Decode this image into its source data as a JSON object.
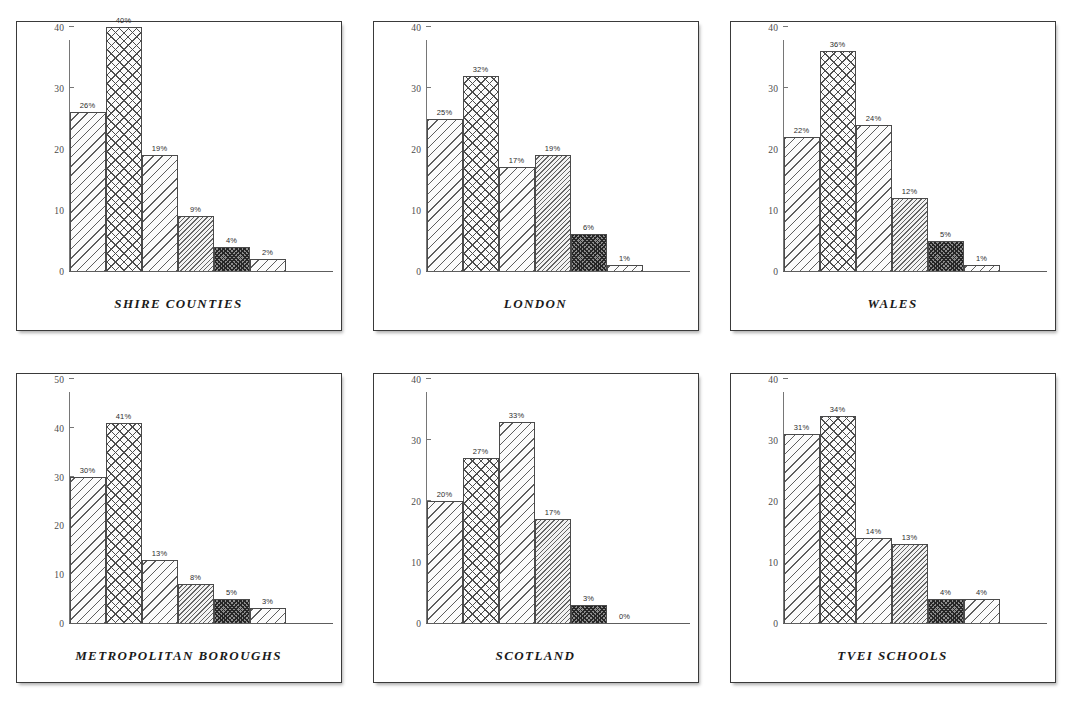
{
  "page": {
    "background_color": "#ffffff",
    "panel_border_color": "#3a3a3a",
    "axis_color": "#767676",
    "label_color": "#2d2d2d"
  },
  "bar_patterns": [
    "diagonal-light-hatch",
    "crosshatch-light",
    "diagonal-light-hatch",
    "diagonal-dense-hatch",
    "crosshatch-dense-dark",
    "diagonal-light-hatch"
  ],
  "chart_data": [
    {
      "type": "bar",
      "title": "SHIRE COUNTIES",
      "categories": [
        "1",
        "2",
        "3",
        "4",
        "5",
        "6"
      ],
      "values": [
        26,
        40,
        19,
        9,
        4,
        2
      ],
      "labels": [
        "26%",
        "40%",
        "19%",
        "9%",
        "4%",
        "2%"
      ],
      "ylim": [
        0,
        40
      ],
      "yticks": [
        0,
        10,
        20,
        30,
        40
      ],
      "ytick_labels": [
        "0",
        "10",
        "20",
        "30",
        "40"
      ],
      "xlabel": "",
      "ylabel": "",
      "grid": false,
      "legend": "none"
    },
    {
      "type": "bar",
      "title": "LONDON",
      "categories": [
        "1",
        "2",
        "3",
        "4",
        "5",
        "6"
      ],
      "values": [
        25,
        32,
        17,
        19,
        6,
        1
      ],
      "labels": [
        "25%",
        "32%",
        "17%",
        "19%",
        "6%",
        "1%"
      ],
      "ylim": [
        0,
        40
      ],
      "yticks": [
        0,
        10,
        20,
        30,
        40
      ],
      "ytick_labels": [
        "0",
        "10",
        "20",
        "30",
        "40"
      ],
      "xlabel": "",
      "ylabel": "",
      "grid": false,
      "legend": "none"
    },
    {
      "type": "bar",
      "title": "WALES",
      "categories": [
        "1",
        "2",
        "3",
        "4",
        "5",
        "6"
      ],
      "values": [
        22,
        36,
        24,
        12,
        5,
        1
      ],
      "labels": [
        "22%",
        "36%",
        "24%",
        "12%",
        "5%",
        "1%"
      ],
      "ylim": [
        0,
        40
      ],
      "yticks": [
        0,
        10,
        20,
        30,
        40
      ],
      "ytick_labels": [
        "0",
        "10",
        "20",
        "30",
        "40"
      ],
      "xlabel": "",
      "ylabel": "",
      "grid": false,
      "legend": "none"
    },
    {
      "type": "bar",
      "title": "METROPOLITAN BOROUGHS",
      "categories": [
        "1",
        "2",
        "3",
        "4",
        "5",
        "6"
      ],
      "values": [
        30,
        41,
        13,
        8,
        5,
        3
      ],
      "labels": [
        "30%",
        "41%",
        "13%",
        "8%",
        "5%",
        "3%"
      ],
      "ylim": [
        0,
        50
      ],
      "yticks": [
        0,
        10,
        20,
        30,
        40,
        50
      ],
      "ytick_labels": [
        "0",
        "10",
        "20",
        "30",
        "40",
        "50"
      ],
      "xlabel": "",
      "ylabel": "",
      "grid": false,
      "legend": "none"
    },
    {
      "type": "bar",
      "title": "SCOTLAND",
      "categories": [
        "1",
        "2",
        "3",
        "4",
        "5",
        "6"
      ],
      "values": [
        20,
        27,
        33,
        17,
        3,
        0
      ],
      "labels": [
        "20%",
        "27%",
        "33%",
        "17%",
        "3%",
        "0%"
      ],
      "ylim": [
        0,
        40
      ],
      "yticks": [
        0,
        10,
        20,
        30,
        40
      ],
      "ytick_labels": [
        "0",
        "10",
        "20",
        "30",
        "40"
      ],
      "xlabel": "",
      "ylabel": "",
      "grid": false,
      "legend": "none"
    },
    {
      "type": "bar",
      "title": "TVEI SCHOOLS",
      "categories": [
        "1",
        "2",
        "3",
        "4",
        "5",
        "6"
      ],
      "values": [
        31,
        34,
        14,
        13,
        4,
        4
      ],
      "labels": [
        "31%",
        "34%",
        "14%",
        "13%",
        "4%",
        "4%"
      ],
      "ylim": [
        0,
        40
      ],
      "yticks": [
        0,
        10,
        20,
        30,
        40
      ],
      "ytick_labels": [
        "0",
        "10",
        "20",
        "30",
        "40"
      ],
      "xlabel": "",
      "ylabel": "",
      "grid": false,
      "legend": "none"
    }
  ]
}
